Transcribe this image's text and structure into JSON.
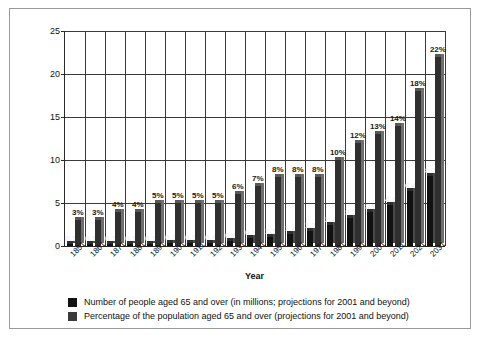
{
  "chart_data": {
    "type": "bar",
    "title": "",
    "xlabel": "Year",
    "ylabel": "",
    "ylim": [
      0,
      25
    ],
    "yticks": [
      0,
      5,
      10,
      15,
      20,
      25
    ],
    "grid": true,
    "legend_position": "bottom-left",
    "categories": [
      "1851",
      "1861",
      "1871",
      "1881",
      "1891",
      "1901",
      "1911",
      "1921",
      "1931",
      "1941",
      "1951",
      "1961",
      "1971",
      "1981",
      "1991",
      "2001",
      "2011",
      "2021",
      "2031"
    ],
    "series": [
      {
        "name": "Number of people aged 65 and over (in millions; projections for 2001 and beyond)",
        "color": "#121212",
        "values": [
          0.1,
          0.1,
          0.1,
          0.1,
          0.2,
          0.3,
          0.3,
          0.4,
          0.6,
          0.9,
          1.1,
          1.4,
          1.7,
          2.4,
          3.2,
          3.9,
          4.8,
          6.4,
          8.1
        ],
        "labels": [
          "0.1",
          "0.1",
          "0.1",
          "0.1",
          "0.2",
          "0.3",
          "0.3",
          "0.4",
          "0.6",
          "0.9",
          "1.1",
          "1.4",
          "1.7",
          "2.4",
          "3.2",
          "3.9",
          "4.8",
          "6.4",
          "8.1"
        ]
      },
      {
        "name": "Percentage of the population aged 65 and over (projections for 2001 and beyond)",
        "color": "#2f2f2f",
        "values": [
          3,
          3,
          4,
          4,
          5,
          5,
          5,
          5,
          6,
          7,
          8,
          8,
          8,
          10,
          12,
          13,
          14,
          18,
          22
        ],
        "labels": [
          "3%",
          "3%",
          "4%",
          "4%",
          "5%",
          "5%",
          "5%",
          "5%",
          "6%",
          "7%",
          "8%",
          "8%",
          "8%",
          "10%",
          "12%",
          "13%",
          "14%",
          "18%",
          "22%"
        ]
      }
    ]
  },
  "axis": {
    "x_title": "Year"
  },
  "legend": {
    "items": [
      {
        "label": "Number of people aged 65 and over (in millions; projections for 2001 and beyond)"
      },
      {
        "label": "Percentage of the population aged 65 and over (projections for 2001 and beyond)"
      }
    ]
  }
}
